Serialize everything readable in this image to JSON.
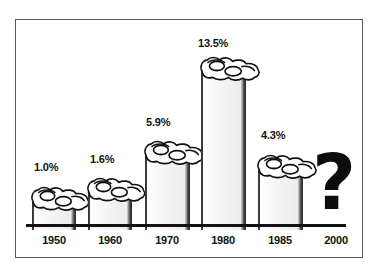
{
  "figure": {
    "name": "smoking-prevalence-bar-chart",
    "frame_color": "#5a5a5a",
    "background": "#ffffff",
    "ink_color": "#111111"
  },
  "chart_data": {
    "type": "bar",
    "title": "",
    "subtitle": "",
    "xlabel": "",
    "ylabel": "",
    "grid": false,
    "legend": null,
    "axis_baseline": true,
    "categories": [
      "1950",
      "1960",
      "1970",
      "1980",
      "1985",
      "2000"
    ],
    "values": [
      1.0,
      1.6,
      5.9,
      13.5,
      4.3,
      null
    ],
    "value_labels": [
      "1.0%",
      "1.6%",
      "5.9%",
      "13.5%",
      "4.3%",
      "?"
    ],
    "ylim": [
      0,
      15
    ],
    "bars": [
      {
        "category": "1950",
        "label": "1.0%",
        "x": 32,
        "width": 44,
        "top": 191,
        "height": 33,
        "smoke": true
      },
      {
        "category": "1960",
        "label": "1.6%",
        "x": 88,
        "width": 44,
        "top": 182,
        "height": 42,
        "smoke": true
      },
      {
        "category": "1970",
        "label": "5.9%",
        "x": 145,
        "width": 45,
        "top": 145,
        "height": 79,
        "smoke": true
      },
      {
        "category": "1980",
        "label": "13.5%",
        "x": 201,
        "width": 45,
        "top": 61,
        "height": 163,
        "smoke": true
      },
      {
        "category": "1985",
        "label": "4.3%",
        "x": 258,
        "width": 45,
        "top": 159,
        "height": 65,
        "smoke": true
      }
    ],
    "value_label_positions": [
      {
        "text": "1.0%",
        "x": 34,
        "y": 161
      },
      {
        "text": "1.6%",
        "x": 90,
        "y": 153
      },
      {
        "text": "5.9%",
        "x": 146,
        "y": 116
      },
      {
        "text": "13.5%",
        "x": 198,
        "y": 37
      },
      {
        "text": "4.3%",
        "x": 261,
        "y": 129
      }
    ],
    "year_label_positions": [
      {
        "text": "1950",
        "x": 30,
        "y": 234
      },
      {
        "text": "1960",
        "x": 86,
        "y": 234
      },
      {
        "text": "1970",
        "x": 143,
        "y": 234
      },
      {
        "text": "1980",
        "x": 199,
        "y": 234
      },
      {
        "text": "1985",
        "x": 256,
        "y": 234
      },
      {
        "text": "2000",
        "x": 312,
        "y": 234
      }
    ],
    "question_mark": {
      "glyph": "?",
      "category": "2000",
      "x": 312,
      "y": 148
    }
  }
}
